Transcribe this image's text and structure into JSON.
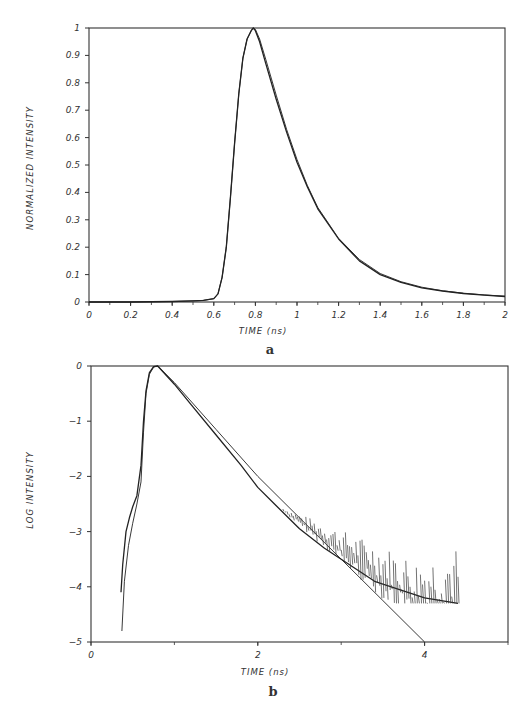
{
  "chart_data": [
    {
      "type": "line",
      "panel_label": "a",
      "title": "",
      "xlabel": "TIME (ns)",
      "ylabel": "NORMALIZED INTENSITY",
      "xlim": [
        0,
        2
      ],
      "ylim": [
        0,
        1
      ],
      "x_ticks": [
        "0",
        "0.2",
        "0.4",
        "0.6",
        "0.8",
        "1",
        "1.2",
        "1.4",
        "1.6",
        "1.8",
        "2"
      ],
      "y_ticks": [
        "0",
        "0.1",
        "0.2",
        "0.3",
        "0.4",
        "0.5",
        "0.6",
        "0.7",
        "0.8",
        "0.9",
        "1"
      ],
      "grid": false,
      "legend": null,
      "series": [
        {
          "name": "measured",
          "x": [
            0,
            0.2,
            0.4,
            0.5,
            0.55,
            0.6,
            0.62,
            0.64,
            0.66,
            0.68,
            0.7,
            0.72,
            0.74,
            0.76,
            0.78,
            0.79,
            0.8,
            0.82,
            0.85,
            0.9,
            0.95,
            1.0,
            1.05,
            1.1,
            1.2,
            1.3,
            1.4,
            1.5,
            1.6,
            1.7,
            1.8,
            1.9,
            2.0
          ],
          "values": [
            0,
            0,
            0.002,
            0.004,
            0.006,
            0.012,
            0.03,
            0.09,
            0.2,
            0.38,
            0.58,
            0.76,
            0.89,
            0.96,
            0.99,
            1.0,
            0.99,
            0.95,
            0.87,
            0.74,
            0.62,
            0.51,
            0.42,
            0.34,
            0.23,
            0.15,
            0.1,
            0.072,
            0.052,
            0.04,
            0.031,
            0.025,
            0.02
          ]
        },
        {
          "name": "fit",
          "x": [
            0,
            0.2,
            0.4,
            0.5,
            0.55,
            0.6,
            0.62,
            0.64,
            0.66,
            0.68,
            0.7,
            0.72,
            0.74,
            0.76,
            0.78,
            0.79,
            0.8,
            0.82,
            0.85,
            0.9,
            0.95,
            1.0,
            1.05,
            1.1,
            1.2,
            1.3,
            1.4,
            1.5,
            1.6,
            1.7,
            1.8,
            1.9,
            2.0
          ],
          "values": [
            0,
            0,
            0.002,
            0.004,
            0.006,
            0.012,
            0.03,
            0.09,
            0.2,
            0.38,
            0.58,
            0.76,
            0.89,
            0.96,
            0.99,
            1.0,
            0.995,
            0.96,
            0.885,
            0.755,
            0.63,
            0.52,
            0.425,
            0.345,
            0.232,
            0.155,
            0.104,
            0.074,
            0.054,
            0.041,
            0.032,
            0.026,
            0.021
          ]
        }
      ]
    },
    {
      "type": "line",
      "panel_label": "b",
      "title": "",
      "xlabel": "TIME (ns)",
      "ylabel": "LOG INTENSITY",
      "xlim": [
        0,
        5
      ],
      "ylim": [
        -5,
        0
      ],
      "x_ticks": [
        "0",
        "2",
        "4"
      ],
      "y_ticks": [
        "-5",
        "-4",
        "-3",
        "-2",
        "-1",
        "0"
      ],
      "grid": false,
      "legend": null,
      "series": [
        {
          "name": "measured (noisy)",
          "x": [
            0.36,
            0.38,
            0.42,
            0.46,
            0.5,
            0.55,
            0.6,
            0.63,
            0.66,
            0.7,
            0.75,
            0.8,
            1.0,
            1.2,
            1.5,
            1.8,
            2.0,
            2.2,
            2.5,
            2.8,
            3.0,
            3.2,
            3.4,
            3.6,
            3.8,
            4.0,
            4.2,
            4.4
          ],
          "values": [
            -4.1,
            -3.6,
            -3.0,
            -2.75,
            -2.55,
            -2.35,
            -1.8,
            -1.0,
            -0.45,
            -0.12,
            -0.01,
            0.0,
            -0.33,
            -0.7,
            -1.25,
            -1.8,
            -2.2,
            -2.5,
            -2.95,
            -3.3,
            -3.5,
            -3.7,
            -3.9,
            -4.0,
            -4.1,
            -4.2,
            -4.25,
            -4.3
          ]
        },
        {
          "name": "fit",
          "x": [
            0.37,
            0.4,
            0.45,
            0.5,
            0.55,
            0.6,
            0.63,
            0.66,
            0.7,
            0.75,
            0.8,
            1.0,
            1.5,
            2.0,
            2.5,
            3.0,
            3.5,
            4.0
          ],
          "values": [
            -4.8,
            -3.9,
            -3.25,
            -2.85,
            -2.5,
            -2.1,
            -1.2,
            -0.5,
            -0.15,
            -0.02,
            0.0,
            -0.3,
            -1.15,
            -2.0,
            -2.75,
            -3.5,
            -4.25,
            -5.0
          ]
        }
      ]
    }
  ]
}
